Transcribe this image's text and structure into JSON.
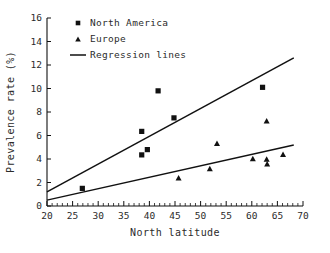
{
  "chart_data": {
    "type": "scatter",
    "title": "",
    "xlabel": "North latitude",
    "ylabel": "Prevalence rate (%)",
    "xlim": [
      20,
      70
    ],
    "ylim": [
      0,
      16
    ],
    "xticks": [
      20,
      25,
      30,
      35,
      40,
      45,
      50,
      55,
      60,
      65,
      70
    ],
    "yticks": [
      0,
      2,
      4,
      6,
      8,
      10,
      12,
      14,
      16
    ],
    "xtick_labels": [
      "20",
      "25",
      "30",
      "35",
      "40",
      "45",
      "50",
      "55",
      "60",
      "65",
      "70"
    ],
    "ytick_labels": [
      "0",
      "2",
      "4",
      "6",
      "8",
      "10",
      "12",
      "14",
      "16"
    ],
    "xminor_step": 1,
    "grid": false,
    "legend_position": "top-left",
    "series": [
      {
        "name": "North America",
        "marker": "square",
        "color": "#111111",
        "points": [
          {
            "x": 26.9,
            "y": 1.5
          },
          {
            "x": 38.5,
            "y": 6.35
          },
          {
            "x": 38.5,
            "y": 4.35
          },
          {
            "x": 39.6,
            "y": 4.8
          },
          {
            "x": 41.7,
            "y": 9.8
          },
          {
            "x": 44.8,
            "y": 7.5
          },
          {
            "x": 62.1,
            "y": 10.1
          }
        ]
      },
      {
        "name": "Europe",
        "marker": "triangle",
        "color": "#111111",
        "points": [
          {
            "x": 45.7,
            "y": 2.4
          },
          {
            "x": 51.8,
            "y": 3.2
          },
          {
            "x": 53.2,
            "y": 5.35
          },
          {
            "x": 60.2,
            "y": 4.05
          },
          {
            "x": 62.9,
            "y": 7.25
          },
          {
            "x": 62.9,
            "y": 4.0
          },
          {
            "x": 63.0,
            "y": 3.6
          },
          {
            "x": 66.1,
            "y": 4.4
          }
        ]
      }
    ],
    "regression_lines": [
      {
        "name": "North America regression",
        "x0": 20,
        "y0": 1.2,
        "x1": 68.2,
        "y1": 12.6
      },
      {
        "name": "Europe regression",
        "x0": 20,
        "y0": 0.5,
        "x1": 68.2,
        "y1": 5.2
      }
    ]
  },
  "legend": {
    "items": [
      {
        "label": "North America",
        "marker": "square"
      },
      {
        "label": "Europe",
        "marker": "triangle"
      },
      {
        "label": "Regression lines",
        "marker": "line"
      }
    ]
  },
  "axes": {
    "x_title": "North latitude",
    "y_title": "Prevalence rate (%)"
  }
}
